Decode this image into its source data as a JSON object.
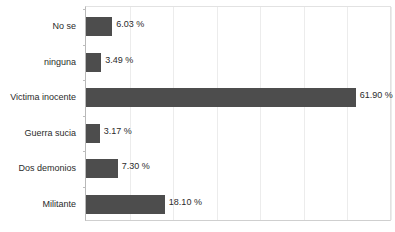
{
  "chart_data": {
    "type": "bar",
    "orientation": "horizontal",
    "title": "",
    "subtitle": "",
    "xlabel": "",
    "ylabel": "",
    "xlim": [
      0,
      70
    ],
    "grid": true,
    "gridline_step": 10,
    "legend": "none",
    "value_suffix": " %",
    "bar_color": "#4d4d4d",
    "gridline_color": "#ececec",
    "axis_color": "#b8b8b8",
    "background_color": "#ffffff",
    "text_color": "#2b2b2b",
    "categories": [
      "No se",
      "ninguna",
      "Victima inocente",
      "Guerra sucia",
      "Dos demonios",
      "Militante"
    ],
    "values": [
      6.03,
      3.49,
      61.9,
      3.17,
      7.3,
      18.1
    ],
    "value_labels": [
      "6.03 %",
      "3.49 %",
      "61.90 %",
      "3.17 %",
      "7.30 %",
      "18.10 %"
    ]
  }
}
